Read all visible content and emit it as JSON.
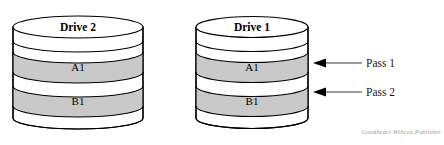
{
  "figure": {
    "title_visible": false,
    "background_color": "#ffffff",
    "outline_color": "#000000",
    "band_fill_color": "#c9c9c9",
    "body_fill_color": "#ffffff",
    "credit": "Goodheart-Willcox Publisher",
    "credit_color": "#9a9a9a"
  },
  "drives": [
    {
      "id": "drive-2",
      "name": "Drive 2",
      "bands": [
        {
          "id": "drive2-band-a1",
          "label": "A1",
          "shaded": true
        },
        {
          "id": "drive2-band-b1",
          "label": "B1",
          "shaded": true
        }
      ]
    },
    {
      "id": "drive-1",
      "name": "Drive 1",
      "bands": [
        {
          "id": "drive1-band-a1",
          "label": "A1",
          "shaded": true
        },
        {
          "id": "drive1-band-b1",
          "label": "B1",
          "shaded": true
        }
      ]
    }
  ],
  "annotations": [
    {
      "id": "pass-1",
      "label": "Pass 1",
      "points_to": "drive1-band-a1"
    },
    {
      "id": "pass-2",
      "label": "Pass 2",
      "points_to": "drive1-band-b1"
    }
  ]
}
